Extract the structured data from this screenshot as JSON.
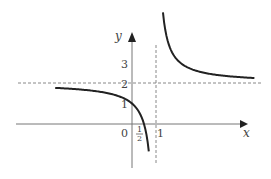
{
  "chart_data": {
    "type": "line",
    "title": "",
    "function": "y = 2 + 1/(x - 1)",
    "xlabel": "x",
    "ylabel": "y",
    "x_tick_labels": [
      "0",
      "1/2",
      "1"
    ],
    "y_tick_labels": [
      "1",
      "2",
      "3"
    ],
    "asymptotes": {
      "vertical": 1,
      "horizontal": 2
    },
    "intercepts": {
      "x": 0.5,
      "y": 1
    },
    "xlim": [
      -4.8,
      4.8
    ],
    "ylim": [
      -2.7,
      6
    ],
    "grid": false,
    "series": [
      {
        "name": "left-branch",
        "x_range": [
          -3.2,
          0.7
        ]
      },
      {
        "name": "right-branch",
        "x_range": [
          1.29,
          5.1
        ]
      }
    ],
    "colors": {
      "curve": "#222222",
      "axis": "#777777",
      "dashed": "#888888"
    }
  }
}
